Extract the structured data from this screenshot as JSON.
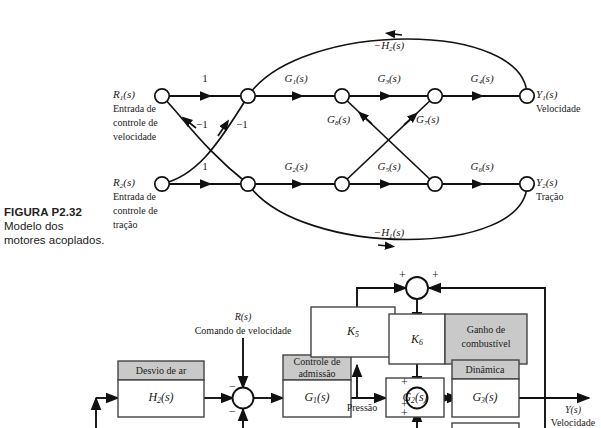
{
  "figure": {
    "caption_title": "FIGURA P2.32",
    "caption_line1": "Modelo dos",
    "caption_line2": "motores acoplados."
  },
  "sfg": {
    "type": "signal-flow-graph",
    "inputs": [
      {
        "symbol_main": "R",
        "symbol_sub": "1",
        "symbol_tail": "(s)",
        "desc_line1": "Entrada de",
        "desc_line2": "controle de",
        "desc_line3": "velocidade"
      },
      {
        "symbol_main": "R",
        "symbol_sub": "2",
        "symbol_tail": "(s)",
        "desc_line1": "Entrada de",
        "desc_line2": "controle de",
        "desc_line3": "tração"
      }
    ],
    "outputs": [
      {
        "symbol_main": "Y",
        "symbol_sub": "1",
        "symbol_tail": "(s)",
        "desc": "Velocidade"
      },
      {
        "symbol_main": "Y",
        "symbol_sub": "2",
        "symbol_tail": "(s)",
        "desc": "Tração"
      }
    ],
    "branch_gains": {
      "top_unity": "1",
      "bottom_unity": "1",
      "cross_left": "−1",
      "cross_right": "−1",
      "g1": {
        "m": "G",
        "s": "1",
        "t": "(s)"
      },
      "g2": {
        "m": "G",
        "s": "2",
        "t": "(s)"
      },
      "g3": {
        "m": "G",
        "s": "3",
        "t": "(s)"
      },
      "g4": {
        "m": "G",
        "s": "4",
        "t": "(s)"
      },
      "g5": {
        "m": "G",
        "s": "5",
        "t": "(s)"
      },
      "g6": {
        "m": "G",
        "s": "6",
        "t": "(s)"
      },
      "g7": {
        "m": "G",
        "s": "7",
        "t": "(s)"
      },
      "g8": {
        "m": "G",
        "s": "8",
        "t": "(s)"
      },
      "h1": {
        "m": "−H",
        "s": "1",
        "t": "(s)"
      },
      "h2": {
        "m": "−H",
        "s": "2",
        "t": "(s)"
      }
    }
  },
  "block_diagram": {
    "type": "block-diagram",
    "reference": {
      "symbol_main": "R",
      "symbol_tail": "(s)",
      "desc": "Comando de velocidade"
    },
    "output": {
      "symbol_main": "Y",
      "symbol_tail": "(s)",
      "desc": "Velocidade"
    },
    "signal_labels": {
      "pressure": "Pressão"
    },
    "blocks": [
      {
        "header": "Desvio de ar",
        "body_main": "H",
        "body_sub": "2",
        "body_tail": "(s)",
        "header_shaded": true
      },
      {
        "header": "Controle de\nadmissão",
        "body_main": "G",
        "body_sub": "1",
        "body_tail": "(s)",
        "header_shaded": true
      },
      {
        "header": "",
        "body_main": "K",
        "body_sub": "5",
        "body_tail": "",
        "header_shaded": false
      },
      {
        "header": "",
        "body_main": "G",
        "body_sub": "2",
        "body_tail": "(s)",
        "header_shaded": false
      },
      {
        "header": "",
        "body_main": "K",
        "body_sub": "6",
        "body_tail": "",
        "side_label_line1": "Ganho de",
        "side_label_line2": "combustível",
        "header_shaded": false
      },
      {
        "header": "Dinâmica",
        "body_main": "G",
        "body_sub": "3",
        "body_tail": "(s)",
        "header_shaded": true
      }
    ],
    "summing_signs": {
      "sum1_top": "−",
      "sum1_bottom": "−",
      "sum_fuel_left": "+",
      "sum_fuel_right": "+",
      "sum_dyn_top": "+",
      "sum_dyn_mid": "+",
      "sum_dyn_bottom": "+"
    }
  },
  "colors": {
    "line": "#111111",
    "shade": "#c9c9c9",
    "block_border": "#444444",
    "paper": "#ffffff"
  }
}
